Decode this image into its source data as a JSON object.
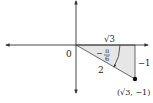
{
  "diagram": {
    "origin_label": "0",
    "hypotenuse_label": "2",
    "adjacent_label": "√3",
    "opposite_label": "−1",
    "angle_label": {
      "sign": "−",
      "numerator": "π",
      "denominator": "6"
    },
    "point_label": "(√3, −1)",
    "colors": {
      "axis": "#333333",
      "triangle_fill": "#e6e6e6",
      "point": "#111111"
    }
  }
}
